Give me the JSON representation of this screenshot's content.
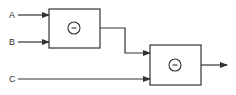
{
  "diagram": {
    "inputs": [
      {
        "label": "A"
      },
      {
        "label": "B"
      },
      {
        "label": "C"
      }
    ],
    "blocks": [
      {
        "id": "block-1",
        "operator": "−",
        "operator_name": "minus"
      },
      {
        "id": "block-2",
        "operator": "−",
        "operator_name": "minus"
      }
    ],
    "colors": {
      "stroke": "#333333",
      "background": "#ffffff"
    }
  }
}
